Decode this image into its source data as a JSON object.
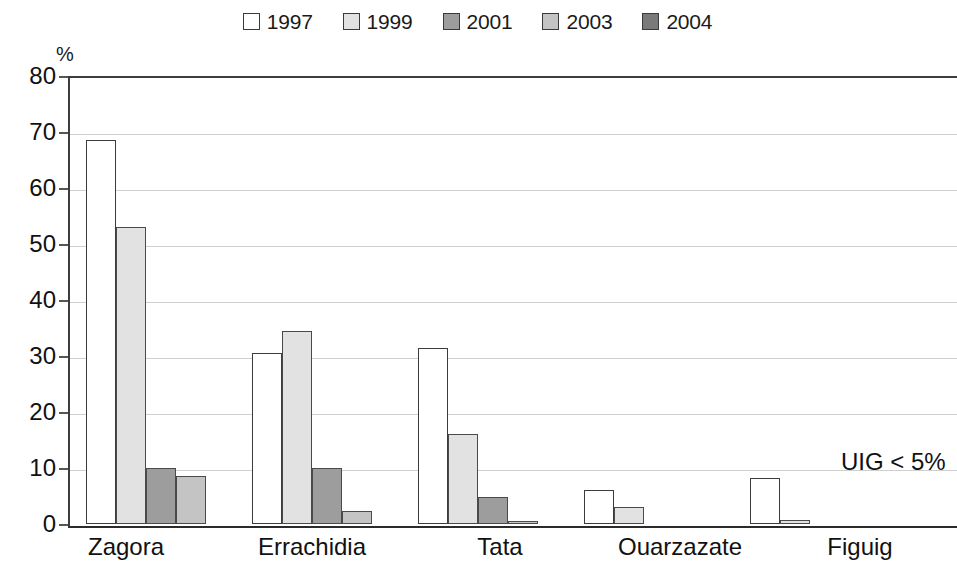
{
  "chart_data": {
    "type": "bar",
    "title": "",
    "subtitle": "",
    "xlabel": "",
    "ylabel": "%",
    "ylim": [
      0,
      80
    ],
    "ytick_step": 10,
    "ytick_labels": [
      "80",
      "70",
      "60",
      "50",
      "40",
      "30",
      "20",
      "10",
      "0"
    ],
    "grid": true,
    "grid_axis": "y",
    "legend_position": "top-center",
    "categories": [
      "Zagora",
      "Errachidia",
      "Tata",
      "Ouarzazate",
      "Figuig"
    ],
    "series": [
      {
        "name": "1997",
        "color": "#ffffff",
        "values": [
          68.5,
          30.5,
          31.5,
          6.0,
          8.3
        ]
      },
      {
        "name": "1999",
        "color": "#e2e2e2",
        "values": [
          53.0,
          34.5,
          16.0,
          3.0,
          0.8
        ]
      },
      {
        "name": "2001",
        "color": "#9d9d9d",
        "values": [
          10.0,
          10.0,
          4.8,
          0.0,
          0.0
        ]
      },
      {
        "name": "2003",
        "color": "#c4c4c4",
        "values": [
          8.5,
          2.3,
          0.6,
          0.0,
          0.0
        ]
      },
      {
        "name": "2004",
        "color": "#7a7a7a",
        "values": [
          0.0,
          0.0,
          0.0,
          0.0,
          0.0
        ]
      }
    ],
    "annotations": [
      {
        "text": "UIG < 5%",
        "x_value": "Figuig",
        "y_value": 11
      }
    ]
  },
  "legend": {
    "items": [
      {
        "label": "1997",
        "swatch": "legend-swatch-1997"
      },
      {
        "label": "1999",
        "swatch": "legend-swatch-1999"
      },
      {
        "label": "2001",
        "swatch": "legend-swatch-2001"
      },
      {
        "label": "2003",
        "swatch": "legend-swatch-2003"
      },
      {
        "label": "2004",
        "swatch": "legend-swatch-2004"
      }
    ]
  },
  "axes": {
    "y_unit_label": "%"
  }
}
